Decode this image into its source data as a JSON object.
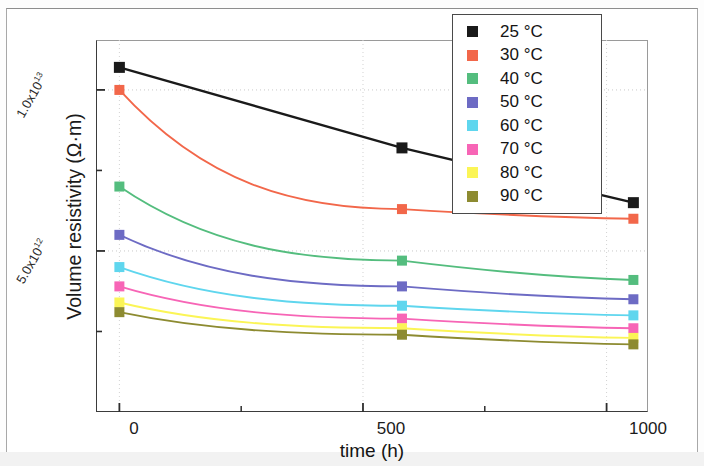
{
  "chart_data": {
    "type": "line",
    "title": "",
    "xlabel": "time (h)",
    "ylabel": "Volume resistivity (Ω·m)",
    "x": [
      0,
      580,
      1055
    ],
    "xlim": [
      -48,
      1085
    ],
    "ylim": [
      0,
      11550000000000
    ],
    "xticks": [
      0,
      500,
      1000
    ],
    "xtick_labels": [
      "0",
      "500",
      "1000"
    ],
    "yticks": [
      5000000000000,
      10000000000000
    ],
    "ytick_labels": [
      "5.0x10¹²",
      "1.0x10¹³"
    ],
    "ytick_mantissas": [
      "5.0x10",
      "1.0x10"
    ],
    "ytick_exponents": [
      "12",
      "13"
    ],
    "grid": "dotted-major",
    "legend_position": "top-right",
    "marker": "square",
    "series": [
      {
        "name": "25 °C",
        "color": "#1a1a1a",
        "values": [
          10700000000000,
          8200000000000,
          6500000000000
        ]
      },
      {
        "name": "30 °C",
        "color": "#f2674a",
        "values": [
          10000000000000,
          6300000000000,
          6000000000000
        ]
      },
      {
        "name": "40 °C",
        "color": "#54bd7e",
        "values": [
          7000000000000,
          4700000000000,
          4100000000000
        ]
      },
      {
        "name": "50 °C",
        "color": "#6d6bc4",
        "values": [
          5500000000000,
          3900000000000,
          3500000000000
        ]
      },
      {
        "name": "60 °C",
        "color": "#5fd6ee",
        "values": [
          4500000000000,
          3300000000000,
          3000000000000
        ]
      },
      {
        "name": "70 °C",
        "color": "#f765b6",
        "values": [
          3900000000000,
          2900000000000,
          2600000000000
        ]
      },
      {
        "name": "80 °C",
        "color": "#fbf556",
        "values": [
          3400000000000,
          2600000000000,
          2300000000000
        ]
      },
      {
        "name": "90 °C",
        "color": "#8d8b31",
        "values": [
          3100000000000,
          2400000000000,
          2100000000000
        ]
      }
    ]
  },
  "axes": {
    "y_title": "Volume resistivity (Ω·m)",
    "x_title": "time (h)",
    "x_tick_0": "0",
    "x_tick_1": "500",
    "x_tick_2": "1000",
    "y_tick_hi_mantissa": "1.0x10",
    "y_tick_hi_exp": "13",
    "y_tick_lo_mantissa": "5.0x10",
    "y_tick_lo_exp": "12"
  },
  "legend": {
    "items": [
      {
        "label": "25 °C",
        "color": "#1a1a1a"
      },
      {
        "label": "30 °C",
        "color": "#f2674a"
      },
      {
        "label": "40 °C",
        "color": "#54bd7e"
      },
      {
        "label": "50 °C",
        "color": "#6d6bc4"
      },
      {
        "label": "60 °C",
        "color": "#5fd6ee"
      },
      {
        "label": "70 °C",
        "color": "#f765b6"
      },
      {
        "label": "80 °C",
        "color": "#fbf556"
      },
      {
        "label": "90 °C",
        "color": "#8d8b31"
      }
    ]
  }
}
